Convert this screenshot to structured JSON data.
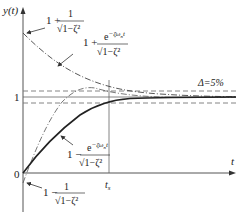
{
  "diagram": {
    "axes": {
      "y_label": "y(t)",
      "x_label": "t",
      "origin_label": "0",
      "one_label": "1",
      "ts_label": "t",
      "ts_subscript": "s"
    },
    "band": {
      "label": "Δ=5%"
    },
    "annotations": {
      "upper_start": {
        "prefix": "1 +",
        "numerator": "1",
        "denominator": "√1−ζ²"
      },
      "upper_envelope": {
        "prefix": "1 +",
        "numerator": "e",
        "exponent": "−ζω",
        "exp_sub": "n",
        "exp_tail": "t",
        "denominator": "√1−ζ²"
      },
      "lower_envelope": {
        "prefix": "1 −",
        "numerator": "e",
        "exponent": "−ζω",
        "exp_sub": "n",
        "exp_tail": "t",
        "denominator": "√1−ζ²"
      },
      "lower_start": {
        "prefix": "1 −",
        "numerator": "1",
        "denominator": "√1−ζ²"
      }
    },
    "colors": {
      "line": "#333333",
      "axis": "#555555",
      "dash": "#777777"
    }
  }
}
